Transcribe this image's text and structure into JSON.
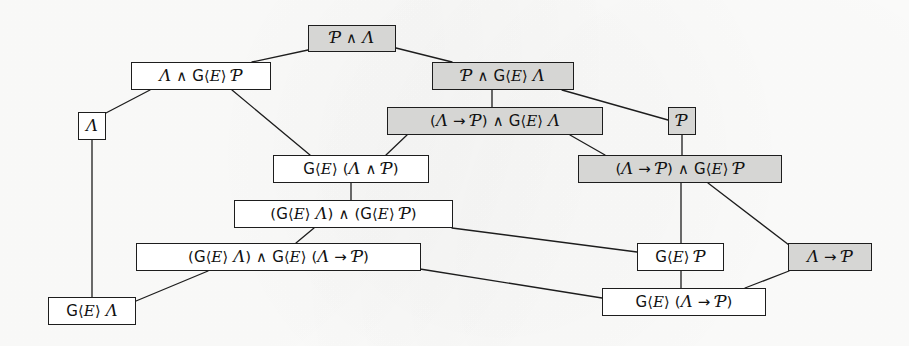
{
  "diagram": {
    "type": "lattice-hasse-diagram",
    "colors": {
      "shaded_node_fill": "#d6d6d4",
      "plain_node_fill": "#ffffff",
      "edge_stroke": "#1d1d1d",
      "border": "#1d1d1d",
      "background": "#fdfdfc"
    },
    "nodes": [
      {
        "id": "n1",
        "label": "Ƥ ∧ Ʌ",
        "text": "G ∧ A",
        "shaded": true,
        "x": 308,
        "y": 25,
        "w": 88,
        "h": 27
      },
      {
        "id": "n2",
        "label": "Ʌ ∧ G⟨E⟩ Ƥ",
        "text": "A ∧ G<E> G",
        "shaded": false,
        "x": 131,
        "y": 62,
        "w": 140,
        "h": 28
      },
      {
        "id": "n3",
        "label": "Ƥ ∧ G⟨E⟩ Ʌ",
        "text": "G ∧ G<E> A",
        "shaded": true,
        "x": 432,
        "y": 62,
        "w": 142,
        "h": 28
      },
      {
        "id": "n4",
        "label": "Ʌ",
        "text": "A",
        "shaded": false,
        "x": 78,
        "y": 112,
        "w": 28,
        "h": 28
      },
      {
        "id": "n5",
        "label": "(Ʌ → Ƥ) ∧ G⟨E⟩ Ʌ",
        "text": "(A -> G) ∧ G<E> A",
        "shaded": true,
        "x": 387,
        "y": 107,
        "w": 216,
        "h": 28
      },
      {
        "id": "n6",
        "label": "Ƥ",
        "text": "G",
        "shaded": true,
        "x": 668,
        "y": 107,
        "w": 28,
        "h": 28
      },
      {
        "id": "n7",
        "label": "G⟨E⟩ (Ʌ ∧ Ƥ)",
        "text": "G<E> (A ∧ G)",
        "shaded": false,
        "x": 273,
        "y": 155,
        "w": 156,
        "h": 28
      },
      {
        "id": "n8",
        "label": "(Ʌ → Ƥ) ∧ G⟨E⟩ Ƥ",
        "text": "(A -> G) ∧ G<E> G",
        "shaded": true,
        "x": 578,
        "y": 155,
        "w": 204,
        "h": 28
      },
      {
        "id": "n9",
        "label": "(G⟨E⟩ Ʌ) ∧ (G⟨E⟩ Ƥ)",
        "text": "(G<E> A) ∧ (G<E> G)",
        "shaded": false,
        "x": 234,
        "y": 200,
        "w": 219,
        "h": 28
      },
      {
        "id": "n10",
        "label": "(G⟨E⟩ Ʌ) ∧ G⟨E⟩ (Ʌ → Ƥ)",
        "text": "(G<E> A) ∧ G<E> (A -> G)",
        "shaded": false,
        "x": 136,
        "y": 243,
        "w": 285,
        "h": 28
      },
      {
        "id": "n11",
        "label": "G⟨E⟩ Ƥ",
        "text": "G<E> G",
        "shaded": false,
        "x": 637,
        "y": 243,
        "w": 87,
        "h": 28
      },
      {
        "id": "n12",
        "label": "Ʌ → Ƥ",
        "text": "A -> G",
        "shaded": true,
        "x": 788,
        "y": 243,
        "w": 84,
        "h": 28
      },
      {
        "id": "n13",
        "label": "G⟨E⟩ Ʌ",
        "text": "G<E> A",
        "shaded": false,
        "x": 48,
        "y": 297,
        "w": 88,
        "h": 28
      },
      {
        "id": "n14",
        "label": "G⟨E⟩ (Ʌ → Ƥ)",
        "text": "G<E> (A -> G)",
        "shaded": false,
        "x": 602,
        "y": 288,
        "w": 164,
        "h": 28
      }
    ],
    "edges": [
      {
        "from": "n1",
        "to": "n2",
        "x1": 308,
        "y1": 50,
        "x2": 252,
        "y2": 62
      },
      {
        "from": "n1",
        "to": "n3",
        "x1": 396,
        "y1": 48,
        "x2": 452,
        "y2": 62
      },
      {
        "from": "n2",
        "to": "n4",
        "x1": 150,
        "y1": 90,
        "x2": 104,
        "y2": 114
      },
      {
        "from": "n2",
        "to": "n7",
        "x1": 232,
        "y1": 90,
        "x2": 310,
        "y2": 155
      },
      {
        "from": "n3",
        "to": "n5",
        "x1": 492,
        "y1": 90,
        "x2": 492,
        "y2": 107
      },
      {
        "from": "n3",
        "to": "n6",
        "x1": 562,
        "y1": 90,
        "x2": 668,
        "y2": 120
      },
      {
        "from": "n4",
        "to": "n13",
        "x1": 92,
        "y1": 140,
        "x2": 92,
        "y2": 297
      },
      {
        "from": "n5",
        "to": "n7",
        "x1": 407,
        "y1": 135,
        "x2": 386,
        "y2": 155
      },
      {
        "from": "n5",
        "to": "n8",
        "x1": 570,
        "y1": 135,
        "x2": 605,
        "y2": 155
      },
      {
        "from": "n6",
        "to": "n8",
        "x1": 682,
        "y1": 135,
        "x2": 682,
        "y2": 155
      },
      {
        "from": "n7",
        "to": "n9",
        "x1": 351,
        "y1": 183,
        "x2": 351,
        "y2": 200
      },
      {
        "from": "n8",
        "to": "n11",
        "x1": 681,
        "y1": 183,
        "x2": 681,
        "y2": 243
      },
      {
        "from": "n8",
        "to": "n12",
        "x1": 708,
        "y1": 183,
        "x2": 789,
        "y2": 245
      },
      {
        "from": "n9",
        "to": "n10",
        "x1": 314,
        "y1": 228,
        "x2": 296,
        "y2": 243
      },
      {
        "from": "n9",
        "to": "n11",
        "x1": 452,
        "y1": 228,
        "x2": 637,
        "y2": 252
      },
      {
        "from": "n10",
        "to": "n13",
        "x1": 208,
        "y1": 271,
        "x2": 136,
        "y2": 301
      },
      {
        "from": "n10",
        "to": "n14",
        "x1": 420,
        "y1": 269,
        "x2": 602,
        "y2": 298
      },
      {
        "from": "n11",
        "to": "n14",
        "x1": 681,
        "y1": 271,
        "x2": 681,
        "y2": 288
      },
      {
        "from": "n12",
        "to": "n14",
        "x1": 789,
        "y1": 271,
        "x2": 745,
        "y2": 288
      }
    ]
  }
}
